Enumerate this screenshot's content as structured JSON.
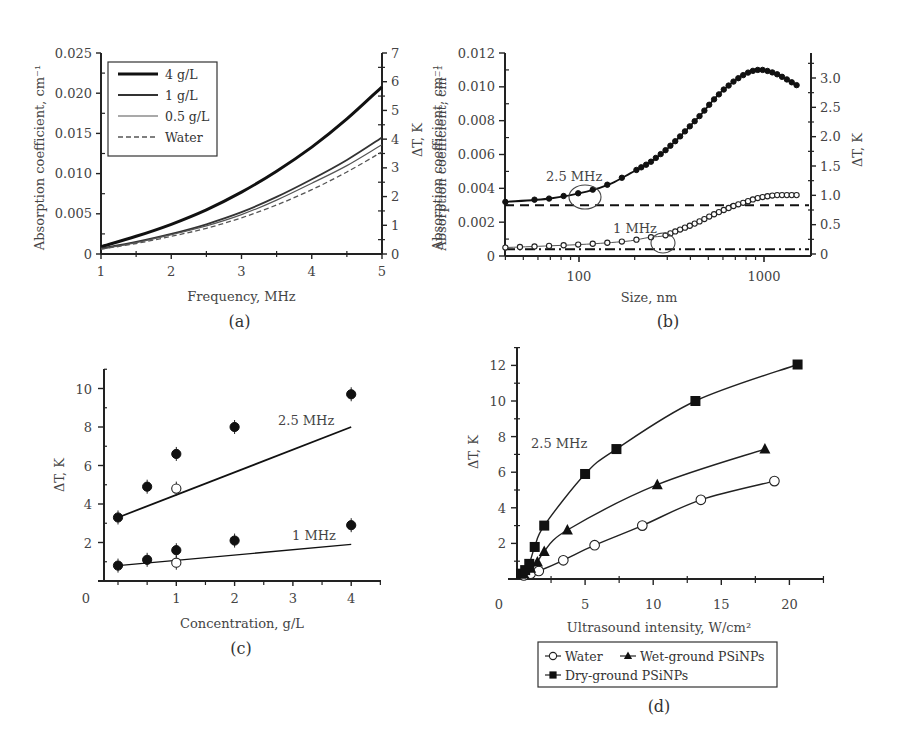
{
  "chart_data": [
    {
      "id": "a",
      "panel_label": "(a)",
      "type": "line",
      "xlabel": "Frequency, MHz",
      "ylabel": "Absorption coefficient, cm⁻¹",
      "y2label": "ΔT, K",
      "xlim": [
        1,
        5
      ],
      "ylim": [
        0,
        0.025
      ],
      "y2lim": [
        0,
        7
      ],
      "xticks": [
        "1",
        "2",
        "3",
        "4",
        "5"
      ],
      "yticks": [
        "0",
        "0.005",
        "0.010",
        "0.015",
        "0.020",
        "0.025"
      ],
      "y2ticks": [
        "0",
        "1",
        "2",
        "3",
        "4",
        "5",
        "6",
        "7"
      ],
      "legend_position": "upper-left",
      "x": [
        1,
        1.5,
        2,
        2.5,
        3,
        3.5,
        4,
        4.5,
        5
      ],
      "series": [
        {
          "name": "4 g/L",
          "style": "thick-solid",
          "values": [
            0.0009,
            0.0022,
            0.0037,
            0.0055,
            0.0077,
            0.0103,
            0.0133,
            0.0168,
            0.0208
          ]
        },
        {
          "name": "1 g/L",
          "style": "solid",
          "values": [
            0.0007,
            0.0015,
            0.0025,
            0.0037,
            0.0052,
            0.0071,
            0.0093,
            0.0117,
            0.0145
          ]
        },
        {
          "name": "0.5 g/L",
          "style": "thin-solid",
          "values": [
            0.0006,
            0.0014,
            0.0024,
            0.0035,
            0.0049,
            0.0067,
            0.0088,
            0.011,
            0.0136
          ]
        },
        {
          "name": "Water",
          "style": "dashed",
          "values": [
            0.0006,
            0.0013,
            0.0022,
            0.0032,
            0.0045,
            0.0061,
            0.008,
            0.0102,
            0.0127
          ]
        }
      ]
    },
    {
      "id": "b",
      "panel_label": "(b)",
      "type": "scatter",
      "xlabel": "Size, nm",
      "ylabel": "Absorption coefficient, cm⁻¹",
      "y2label": "ΔT, K",
      "xscale": "log",
      "xlim": [
        40,
        1800
      ],
      "ylim": [
        0,
        0.012
      ],
      "y2lim": [
        0,
        3.4
      ],
      "xticks": [
        "100",
        "1000"
      ],
      "yticks": [
        "0",
        "0.002",
        "0.004",
        "0.006",
        "0.008",
        "0.010",
        "0.012"
      ],
      "y2ticks": [
        "0",
        "0.5",
        "1.0",
        "1.5",
        "2.0",
        "2.5",
        "3.0"
      ],
      "annotations": [
        "2.5 MHz",
        "1 MHz"
      ],
      "x": [
        40,
        70,
        110,
        150,
        190,
        240,
        290,
        340,
        400,
        460,
        520,
        600,
        700,
        800,
        900,
        1000,
        1150,
        1300,
        1500
      ],
      "series": [
        {
          "name": "2.5 MHz (nanoparticles)",
          "marker": "filled-circle",
          "values": [
            0.0032,
            0.0034,
            0.0038,
            0.0043,
            0.0049,
            0.0055,
            0.0062,
            0.0069,
            0.0077,
            0.0084,
            0.0091,
            0.0098,
            0.0104,
            0.0108,
            0.011,
            0.011,
            0.0108,
            0.0105,
            0.0101
          ]
        },
        {
          "name": "1 MHz (nanoparticles)",
          "marker": "open-circle",
          "values": [
            0.0005,
            0.0006,
            0.0007,
            0.0008,
            0.0009,
            0.0011,
            0.0012,
            0.0015,
            0.0018,
            0.0021,
            0.0024,
            0.0027,
            0.003,
            0.0032,
            0.0034,
            0.0035,
            0.0036,
            0.0036,
            0.0036
          ]
        },
        {
          "name": "2.5 MHz water",
          "style": "dashed",
          "values": [
            0.003
          ]
        },
        {
          "name": "1 MHz water",
          "style": "dash-dot",
          "values": [
            0.0004
          ]
        }
      ]
    },
    {
      "id": "c",
      "panel_label": "(c)",
      "type": "scatter",
      "xlabel": "Concentration, g/L",
      "ylabel": "ΔT, K",
      "xlim": [
        0,
        4.5
      ],
      "ylim": [
        0,
        11
      ],
      "xticks": [
        "0",
        "1",
        "2",
        "3",
        "4"
      ],
      "yticks": [
        "2",
        "4",
        "6",
        "8",
        "10"
      ],
      "annotations": [
        "2.5 MHz",
        "1 MHz"
      ],
      "categories": [
        0,
        0.5,
        1,
        2,
        4
      ],
      "series": [
        {
          "name": "2.5 MHz measured",
          "marker": "filled-circle",
          "x": [
            0,
            0.5,
            1,
            2,
            4
          ],
          "values": [
            3.3,
            4.9,
            6.6,
            8.0,
            9.7
          ]
        },
        {
          "name": "2.5 MHz open",
          "marker": "open-circle",
          "x": [
            1
          ],
          "values": [
            4.8
          ]
        },
        {
          "name": "2.5 MHz fit",
          "style": "solid",
          "x": [
            0,
            4
          ],
          "values": [
            3.3,
            8.0
          ]
        },
        {
          "name": "1 MHz measured",
          "marker": "filled-circle",
          "x": [
            0,
            0.5,
            1,
            2,
            4
          ],
          "values": [
            0.8,
            1.1,
            1.6,
            2.1,
            2.9
          ]
        },
        {
          "name": "1 MHz open",
          "marker": "open-circle",
          "x": [
            1
          ],
          "values": [
            0.95
          ]
        },
        {
          "name": "1 MHz fit",
          "style": "solid",
          "x": [
            0,
            4
          ],
          "values": [
            0.8,
            1.9
          ]
        }
      ]
    },
    {
      "id": "d",
      "panel_label": "(d)",
      "type": "line",
      "xlabel": "Ultrasound intensity, W/cm²",
      "ylabel": "ΔT, K",
      "xlim": [
        0,
        22.5
      ],
      "ylim": [
        0,
        13
      ],
      "xticks": [
        "0",
        "5",
        "10",
        "15",
        "20"
      ],
      "yticks": [
        "2",
        "4",
        "6",
        "8",
        "10",
        "12"
      ],
      "annotations": [
        "2.5 MHz"
      ],
      "legend_position": "below",
      "series": [
        {
          "name": "Water",
          "marker": "open-circle",
          "x": [
            0.5,
            1.0,
            1.6,
            3.4,
            5.7,
            9.2,
            13.5,
            18.9
          ],
          "values": [
            0.2,
            0.3,
            0.45,
            1.05,
            1.9,
            3.0,
            4.45,
            5.5
          ]
        },
        {
          "name": "Wet-ground PSiNPs",
          "marker": "filled-triangle",
          "x": [
            0.5,
            1.0,
            1.5,
            2.0,
            3.7,
            10.3,
            18.2
          ],
          "values": [
            0.3,
            0.6,
            0.95,
            1.55,
            2.75,
            5.3,
            7.3
          ]
        },
        {
          "name": "Dry-ground PSiNPs",
          "marker": "filled-square",
          "x": [
            0.3,
            0.6,
            0.9,
            1.3,
            2.0,
            5.0,
            7.3,
            13.1,
            20.6
          ],
          "values": [
            0.3,
            0.5,
            0.85,
            1.8,
            3.0,
            5.9,
            7.3,
            10.0,
            12.05
          ]
        }
      ]
    }
  ],
  "figure": {
    "panels": [
      {
        "label": "(a)"
      },
      {
        "label": "(b)"
      },
      {
        "label": "(c)"
      },
      {
        "label": "(d)"
      }
    ]
  }
}
